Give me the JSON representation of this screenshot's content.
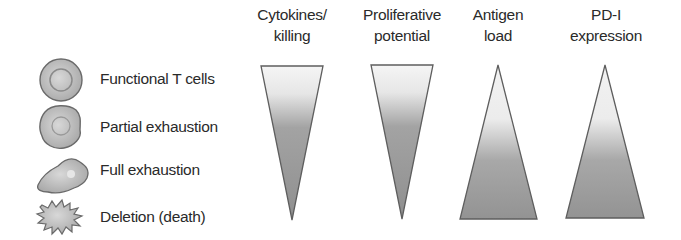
{
  "columns": [
    {
      "line1": "Cytokines/",
      "line2": "killing",
      "direction": "decreasing"
    },
    {
      "line1": "Proliferative",
      "line2": "potential",
      "direction": "decreasing"
    },
    {
      "line1": "Antigen",
      "line2": "load",
      "direction": "increasing"
    },
    {
      "line1": "PD-I",
      "line2": "expression",
      "direction": "increasing"
    }
  ],
  "legend": [
    {
      "label": "Functional T cells",
      "icon": "round-cell-icon"
    },
    {
      "label": "Partial exhaustion",
      "icon": "irregular-cell-icon"
    },
    {
      "label": "Full exhaustion",
      "icon": "spread-cell-icon"
    },
    {
      "label": "Deletion (death)",
      "icon": "spiky-cell-icon"
    }
  ],
  "colors": {
    "light": "#f4f4f4",
    "dark": "#8e8e8e",
    "stroke": "#5a5a5a"
  }
}
